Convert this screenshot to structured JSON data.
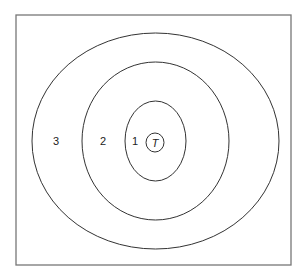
{
  "diagram": {
    "frame": {
      "x": 16,
      "y": 15,
      "width": 275,
      "height": 250,
      "stroke": "#777777"
    },
    "rings": [
      {
        "name": "ring-3",
        "cx": 155.5,
        "cy": 141,
        "rx": 123.5,
        "ry": 108
      },
      {
        "name": "ring-2",
        "cx": 155.5,
        "cy": 141,
        "rx": 73.5,
        "ry": 79
      },
      {
        "name": "ring-1",
        "cx": 155.5,
        "cy": 141,
        "rx": 30.5,
        "ry": 40
      },
      {
        "name": "target",
        "cx": 155,
        "cy": 142.5,
        "rx": 9,
        "ry": 9.5
      }
    ],
    "labels": {
      "ring3": "3",
      "ring2": "2",
      "ring1": "1",
      "target": "T"
    },
    "line_color": "#333333"
  }
}
